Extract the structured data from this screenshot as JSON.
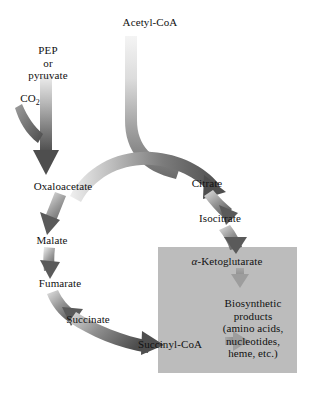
{
  "diagram": {
    "type": "pathway-diagram",
    "background_color": "#ffffff",
    "highlight_box_color": "#bcbcbc",
    "arrow_color_light": "#e8e8e8",
    "arrow_color_mid": "#9a9a9a",
    "arrow_color_dark": "#4a4a4a",
    "nodes": {
      "pep": {
        "line1": "PEP",
        "line2": "or",
        "line3": "pyruvate"
      },
      "co2": {
        "text": "CO",
        "subscript": "2"
      },
      "acetyl_coa": {
        "label": "Acetyl-CoA"
      },
      "oxaloacetate": {
        "label": "Oxaloacetate"
      },
      "citrate": {
        "label": "Citrate"
      },
      "isocitrate": {
        "label": "Isocitrate"
      },
      "malate": {
        "label": "Malate"
      },
      "fumarate": {
        "label": "Fumarate"
      },
      "succinate": {
        "label": "Succinate"
      },
      "succinyl_coa": {
        "label": "Succinyl-CoA"
      },
      "alpha_ketoglutarate": {
        "greek": "α",
        "rest": "-Ketoglutarate"
      },
      "biosynthetic_products": {
        "line1": "Biosynthetic",
        "line2": "products",
        "line3": "(amino acids,",
        "line4": "nucleotides,",
        "line5": "heme, etc.)"
      }
    },
    "arrows": [
      {
        "name": "pep-to-oxaloacetate",
        "from": "PEP or pyruvate",
        "to": "Oxaloacetate",
        "style": "straight-vertical"
      },
      {
        "name": "co2-to-oxaloacetate",
        "from": "CO2",
        "to": "Oxaloacetate",
        "style": "short-curve"
      },
      {
        "name": "acetylcoa-to-citrate",
        "from": "Acetyl-CoA",
        "to": "Citrate",
        "style": "vertical-then-curve"
      },
      {
        "name": "oxaloacetate-to-citrate",
        "from": "Oxaloacetate",
        "to": "Citrate",
        "style": "arc-over-top"
      },
      {
        "name": "citrate-to-isocitrate",
        "from": "Citrate",
        "to": "Isocitrate",
        "style": "curve-down-right"
      },
      {
        "name": "isocitrate-to-ketoglutarate",
        "from": "Isocitrate",
        "to": "alpha-Ketoglutarate",
        "style": "curve-down"
      },
      {
        "name": "ketoglutarate-to-biosynthetic",
        "from": "alpha-Ketoglutarate",
        "to": "Biosynthetic products",
        "style": "short-down"
      },
      {
        "name": "succinylcoa-to-biosynthetic",
        "from": "Succinyl-CoA",
        "to": "Biosynthetic products",
        "style": "short-right"
      },
      {
        "name": "oxaloacetate-to-malate",
        "from": "Oxaloacetate",
        "to": "Malate",
        "style": "curve-down-left"
      },
      {
        "name": "malate-to-fumarate",
        "from": "Malate",
        "to": "Fumarate",
        "style": "curve-down"
      },
      {
        "name": "fumarate-to-succinate",
        "from": "Fumarate",
        "to": "Succinate",
        "style": "curve-down-right"
      },
      {
        "name": "succinate-to-succinylcoa",
        "from": "Succinate",
        "to": "Succinyl-CoA",
        "style": "curve-right"
      }
    ]
  }
}
